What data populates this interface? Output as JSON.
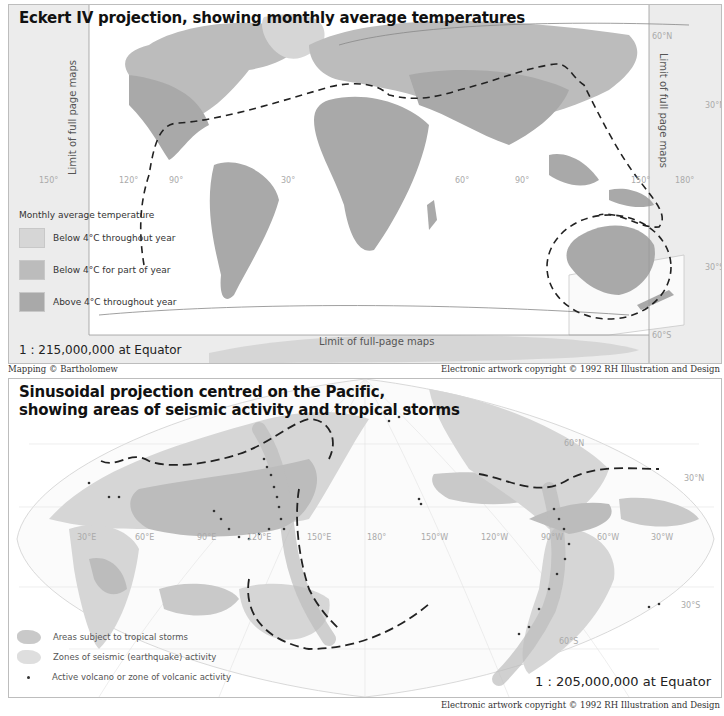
{
  "top_map": {
    "title": "Eckert IV projection, showing monthly average temperatures",
    "legend": {
      "title": "Monthly average temperature",
      "items": [
        {
          "label": "Below 4°C throughout year",
          "color": "#d6d6d6"
        },
        {
          "label": "Below 4°C for part of year",
          "color": "#bcbcbc"
        },
        {
          "label": "Above 4°C throughout year",
          "color": "#a9a9a9"
        }
      ]
    },
    "limit_label_left": "Limit of full page maps",
    "limit_label_right": "Limit of full page maps",
    "limit_label_bottom": "Limit of full-page maps",
    "scale": "1 : 215,000,000 at Equator",
    "longitude_ticks": [
      "150°",
      "120°",
      "90°",
      "30°",
      "0°",
      "60°",
      "90°",
      "150°",
      "180°"
    ],
    "latitude_ticks": [
      "60°N",
      "30°N",
      "30°S",
      "60°S"
    ],
    "credit_left": "Mapping © Bartholomew",
    "credit_right": "Electronic artwork copyright © 1992 RH Illustration and Design"
  },
  "bottom_map": {
    "title_line1": "Sinusoidal projection centred on the Pacific,",
    "title_line2": "showing areas of seismic activity and tropical storms",
    "legend": {
      "items": [
        {
          "label": "Areas subject to tropical storms",
          "color": "#c9c9c9"
        },
        {
          "label": "Zones of seismic (earthquake) activity",
          "color": "#dedede"
        },
        {
          "label": "Active volcano or zone of volcanic activity",
          "color": "#333333"
        }
      ]
    },
    "longitude_ticks": [
      "30°E",
      "60°E",
      "90°E",
      "120°E",
      "150°E",
      "180°",
      "150°W",
      "120°W",
      "90°W",
      "60°W",
      "30°W"
    ],
    "latitude_ticks": [
      "60°N",
      "30°N",
      "30°S",
      "60°S"
    ],
    "scale": "1 : 205,000,000 at Equator",
    "credit_right": "Electronic artwork copyright © 1992 RH Illustration and Design"
  },
  "colors": {
    "land_dark": "#a9a9a9",
    "land_mid": "#bcbcbc",
    "land_light": "#d6d6d6",
    "margin_gray": "#ececec",
    "dash_line": "#222222"
  }
}
